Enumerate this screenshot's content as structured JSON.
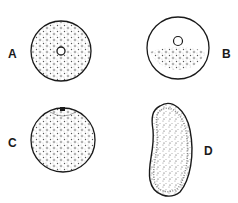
{
  "figure": {
    "panels": [
      {
        "label": "A",
        "shape": "circle",
        "nucleus": "central"
      },
      {
        "label": "B",
        "shape": "circle",
        "nucleus": "eccentric-upper"
      },
      {
        "label": "C",
        "shape": "circle",
        "nucleus": "peripheral-top"
      },
      {
        "label": "D",
        "shape": "bean",
        "nucleus": "none"
      }
    ],
    "colors": {
      "ink": "#1a1a1a",
      "background": "#ffffff"
    }
  }
}
